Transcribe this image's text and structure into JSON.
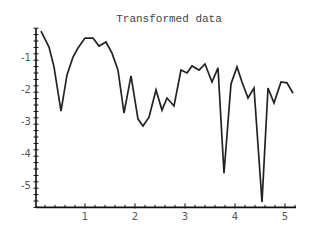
{
  "chart_data": {
    "type": "line",
    "title": "Transformed data",
    "xlabel": "",
    "ylabel": "",
    "xlim": [
      0,
      5.2
    ],
    "ylim": [
      -5.7,
      -0.1
    ],
    "x_ticks": [
      1,
      2,
      3,
      4,
      5
    ],
    "x_tick_labels": [
      "1",
      "2",
      "3",
      "4",
      "5"
    ],
    "y_ticks": [
      -1,
      -2,
      -3,
      -4,
      -5
    ],
    "y_tick_labels": [
      "-1",
      "-2",
      "-3",
      "-4",
      "-5"
    ],
    "x_minor_step": 0.2,
    "y_minor_step": 0.2,
    "grid": false,
    "legend": null,
    "series": [
      {
        "name": "transformed",
        "color": "#222222",
        "x": [
          0.12,
          0.28,
          0.38,
          0.52,
          0.64,
          0.76,
          0.86,
          1.0,
          1.16,
          1.28,
          1.42,
          1.54,
          1.66,
          1.78,
          1.92,
          2.06,
          2.16,
          2.28,
          2.42,
          2.54,
          2.64,
          2.78,
          2.92,
          3.04,
          3.14,
          3.28,
          3.4,
          3.54,
          3.66,
          3.78,
          3.92,
          4.04,
          4.14,
          4.26,
          4.38,
          4.54,
          4.66,
          4.78,
          4.92,
          5.04,
          5.16
        ],
        "y": [
          -0.19,
          -0.69,
          -1.31,
          -2.69,
          -1.56,
          -1.0,
          -0.72,
          -0.41,
          -0.41,
          -0.66,
          -0.53,
          -0.88,
          -1.41,
          -2.75,
          -1.59,
          -2.94,
          -3.16,
          -2.88,
          -2.03,
          -2.66,
          -2.28,
          -2.53,
          -1.41,
          -1.5,
          -1.28,
          -1.41,
          -1.22,
          -1.78,
          -1.34,
          -4.63,
          -1.84,
          -1.31,
          -1.78,
          -2.28,
          -1.97,
          -5.53,
          -1.97,
          -2.44,
          -1.78,
          -1.81,
          -2.13
        ]
      }
    ]
  }
}
